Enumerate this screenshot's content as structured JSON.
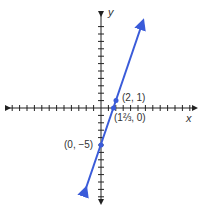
{
  "chart_data": {
    "type": "line",
    "title": "",
    "xlabel": "x",
    "ylabel": "y",
    "xlim": [
      -13,
      13
    ],
    "ylim": [
      -12,
      12
    ],
    "grid": false,
    "series": [
      {
        "name": "y = 3x - 5",
        "x": [
          -2.3,
          5.7
        ],
        "y": [
          -11.9,
          11.1
        ],
        "color": "#3a5bd9"
      }
    ],
    "points": [
      {
        "x": 2,
        "y": 1,
        "label": "(2, 1)"
      },
      {
        "x": 1.6667,
        "y": 0,
        "label": "(1⅔, 0)"
      },
      {
        "x": 0,
        "y": -5,
        "label": "(0, −5)"
      }
    ]
  },
  "labels": {
    "x_axis": "x",
    "y_axis": "y",
    "p1": "(2, 1)",
    "p2": "(1⅔, 0)",
    "p3": "(0, −5)"
  }
}
